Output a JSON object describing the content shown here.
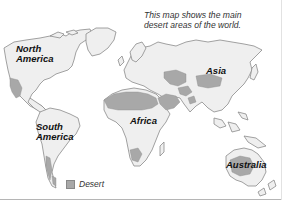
{
  "caption": {
    "line1": "This map shows the main",
    "line2": "desert areas of the world."
  },
  "labels": {
    "north_america": [
      "North",
      "America"
    ],
    "south_america": [
      "South",
      "America"
    ],
    "africa": "Africa",
    "asia": "Asia",
    "australia": "Australia"
  },
  "legend": {
    "items": [
      {
        "label": "Desert",
        "color": "#a8a8a8"
      }
    ]
  },
  "colors": {
    "land": "#efefef",
    "outline": "#8a8a8a",
    "desert": "#a8a8a8",
    "background": "#ffffff"
  }
}
